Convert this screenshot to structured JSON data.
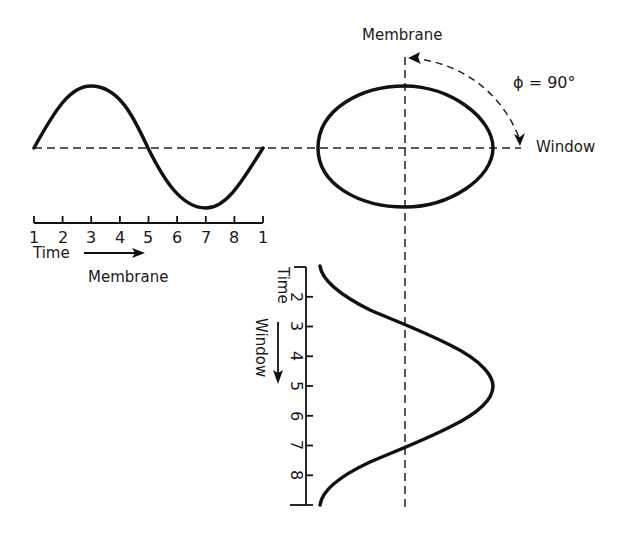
{
  "labels": {
    "membrane_top": "Membrane",
    "phase": "ϕ = 90°",
    "window_right": "Window",
    "time_horizontal": "Time",
    "membrane_bottom": "Membrane",
    "time_vertical": "Time",
    "window_vertical": "Window"
  },
  "horizontal_axis": {
    "ticks": [
      "1",
      "2",
      "3",
      "4",
      "5",
      "6",
      "7",
      "8",
      "1"
    ]
  },
  "vertical_axis": {
    "ticks": [
      "1",
      "2",
      "3",
      "4",
      "5",
      "6",
      "7",
      "8",
      ""
    ]
  },
  "colors": {
    "ink": "#111111",
    "background": "#ffffff"
  }
}
